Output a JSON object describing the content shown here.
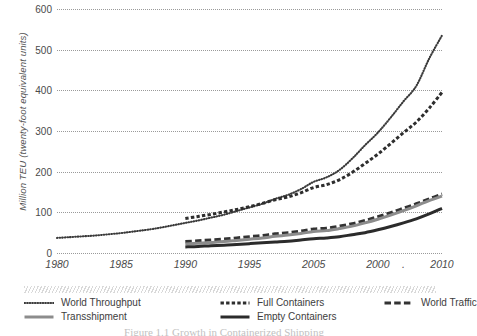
{
  "chart_data": {
    "type": "line",
    "title": "",
    "xlabel": "",
    "ylabel": "Million TEU (twenty-foot equivalent units)",
    "xlim": [
      1980,
      2010
    ],
    "ylim": [
      0,
      600
    ],
    "grid": true,
    "grid_axis": "y",
    "legend_position": "below",
    "y_ticks": [
      0,
      100,
      200,
      300,
      400,
      500,
      600
    ],
    "y_tick_labels": [
      "0",
      "100",
      "200",
      "300",
      "400",
      "500",
      "600"
    ],
    "x_ticks": [
      1980,
      1985,
      1990,
      1995,
      2000,
      2005,
      2007,
      2010
    ],
    "x_tick_labels": [
      "1980",
      "1985",
      "1990",
      "1995",
      "2005",
      "2000",
      ".",
      "2010"
    ],
    "series": [
      {
        "name": "World Throughput",
        "style": "fine-dotted",
        "color": "#3a3a3a",
        "x": [
          1980,
          1981,
          1982,
          1983,
          1984,
          1985,
          1986,
          1987,
          1988,
          1989,
          1990,
          1991,
          1992,
          1993,
          1994,
          1995,
          1996,
          1997,
          1998,
          1999,
          2000,
          2001,
          2002,
          2003,
          2004,
          2005,
          2006,
          2007,
          2008,
          2009,
          2010
        ],
        "values": [
          37,
          39,
          41,
          43,
          46,
          49,
          53,
          57,
          62,
          68,
          74,
          80,
          87,
          94,
          103,
          112,
          121,
          133,
          143,
          157,
          175,
          186,
          204,
          232,
          265,
          296,
          333,
          373,
          411,
          478,
          535
        ]
      },
      {
        "name": "Full Containers",
        "style": "medium-dash",
        "color": "#2e2e2e",
        "x": [
          1990,
          1991,
          1992,
          1993,
          1994,
          1995,
          1996,
          1997,
          1998,
          1999,
          2000,
          2001,
          2002,
          2003,
          2004,
          2005,
          2006,
          2007,
          2008,
          2009,
          2010
        ],
        "values": [
          85,
          90,
          95,
          101,
          107,
          114,
          122,
          131,
          138,
          148,
          161,
          168,
          180,
          198,
          220,
          243,
          269,
          296,
          322,
          356,
          395
        ]
      },
      {
        "name": "World Traffic",
        "style": "long-dash",
        "color": "#333333",
        "x": [
          1990,
          1991,
          1992,
          1993,
          1994,
          1995,
          1996,
          1997,
          1998,
          1999,
          2000,
          2001,
          2002,
          2003,
          2004,
          2005,
          2006,
          2007,
          2008,
          2009,
          2010
        ],
        "values": [
          28,
          30,
          32,
          34,
          37,
          40,
          43,
          47,
          50,
          54,
          59,
          61,
          66,
          72,
          80,
          89,
          99,
          110,
          121,
          133,
          145
        ]
      },
      {
        "name": "Transshipment",
        "style": "solid-gray",
        "color": "#8c8c8c",
        "x": [
          1990,
          1991,
          1992,
          1993,
          1994,
          1995,
          1996,
          1997,
          1998,
          1999,
          2000,
          2001,
          2002,
          2003,
          2004,
          2005,
          2006,
          2007,
          2008,
          2009,
          2010
        ],
        "values": [
          22,
          24,
          26,
          28,
          31,
          34,
          37,
          41,
          44,
          48,
          53,
          55,
          60,
          66,
          74,
          83,
          93,
          104,
          116,
          129,
          140
        ]
      },
      {
        "name": "Empty Containers",
        "style": "solid-dark",
        "color": "#2b2b2b",
        "x": [
          1990,
          1991,
          1992,
          1993,
          1994,
          1995,
          1996,
          1997,
          1998,
          1999,
          2000,
          2001,
          2002,
          2003,
          2004,
          2005,
          2006,
          2007,
          2008,
          2009,
          2010
        ],
        "values": [
          15,
          16,
          18,
          19,
          21,
          23,
          25,
          27,
          29,
          32,
          35,
          37,
          40,
          45,
          50,
          57,
          65,
          74,
          84,
          96,
          110
        ]
      }
    ],
    "legend": [
      {
        "label": "World Throughput",
        "style": "fine-dotted",
        "color": "#3a3a3a"
      },
      {
        "label": "Full Containers",
        "style": "medium-dash",
        "color": "#2e2e2e"
      },
      {
        "label": "World Traffic",
        "style": "long-dash",
        "color": "#333333"
      },
      {
        "label": "Transshipment",
        "style": "solid-gray",
        "color": "#8c8c8c"
      },
      {
        "label": "Empty Containers",
        "style": "solid-dark",
        "color": "#2b2b2b"
      }
    ]
  },
  "caption": "Figure 1.1   Growth in Containerized Shipping"
}
